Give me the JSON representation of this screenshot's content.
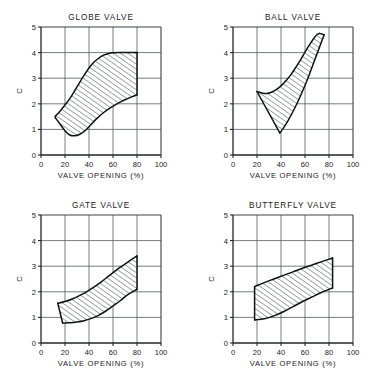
{
  "figure": {
    "background_color": "#ffffff",
    "ink_color": "#1a1a1a",
    "grid_color": "#555a5e",
    "hatch_color": "#2b2f33",
    "panel_count": 4
  },
  "chart_data": [
    {
      "type": "area",
      "title": "GLOBE VALVE",
      "xlabel": "VALVE OPENING (%)",
      "ylabel": "C",
      "xlim": [
        0,
        100
      ],
      "ylim": [
        0,
        5
      ],
      "xticks": [
        0,
        20,
        40,
        60,
        80,
        100
      ],
      "yticks": [
        0,
        1,
        2,
        3,
        4,
        5
      ],
      "xtick_labels": [
        "0",
        "20",
        "40",
        "60",
        "80",
        "100"
      ],
      "ytick_labels": [
        "0",
        "1",
        "2",
        "3",
        "4",
        "5"
      ],
      "grid": true,
      "legend": "none",
      "fill_style": "diagonal-hatch",
      "series": [
        {
          "name": "upper bound",
          "x": [
            12,
            16,
            20,
            24,
            28,
            32,
            36,
            40,
            44,
            48,
            52,
            56,
            60,
            66,
            72,
            80
          ],
          "y": [
            1.52,
            1.72,
            1.95,
            2.2,
            2.5,
            2.82,
            3.12,
            3.4,
            3.62,
            3.78,
            3.9,
            3.96,
            3.99,
            4.0,
            4.0,
            4.0
          ]
        },
        {
          "name": "lower bound",
          "x": [
            12,
            16,
            20,
            24,
            28,
            32,
            36,
            40,
            46,
            52,
            58,
            64,
            70,
            76,
            80
          ],
          "y": [
            1.45,
            1.2,
            0.95,
            0.78,
            0.75,
            0.8,
            0.92,
            1.1,
            1.4,
            1.65,
            1.85,
            2.02,
            2.16,
            2.28,
            2.35
          ]
        }
      ]
    },
    {
      "type": "area",
      "title": "BALL VALVE",
      "xlabel": "VALVE OPENING (%)",
      "ylabel": "C",
      "xlim": [
        0,
        100
      ],
      "ylim": [
        0,
        5
      ],
      "xticks": [
        0,
        20,
        40,
        60,
        80,
        100
      ],
      "yticks": [
        0,
        1,
        2,
        3,
        4,
        5
      ],
      "xtick_labels": [
        "0",
        "20",
        "40",
        "60",
        "80",
        "100"
      ],
      "ytick_labels": [
        "0",
        "1",
        "2",
        "3",
        "4",
        "5"
      ],
      "grid": true,
      "legend": "none",
      "fill_style": "diagonal-hatch",
      "series": [
        {
          "name": "upper bound",
          "x": [
            20,
            24,
            28,
            32,
            36,
            40,
            44,
            48,
            52,
            56,
            60,
            64,
            68,
            70,
            72
          ],
          "y": [
            2.48,
            2.42,
            2.4,
            2.45,
            2.55,
            2.7,
            2.9,
            3.12,
            3.4,
            3.7,
            4.02,
            4.32,
            4.6,
            4.7,
            4.75
          ]
        },
        {
          "name": "lower bound",
          "x": [
            39,
            42,
            46,
            50,
            54,
            58,
            62,
            66,
            70,
            74,
            76
          ],
          "y": [
            0.86,
            1.05,
            1.35,
            1.7,
            2.08,
            2.5,
            2.95,
            3.45,
            3.95,
            4.45,
            4.7
          ]
        }
      ]
    },
    {
      "type": "area",
      "title": "GATE VALVE",
      "xlabel": "VALVE OPENING (%)",
      "ylabel": "C",
      "xlim": [
        0,
        100
      ],
      "ylim": [
        0,
        5
      ],
      "xticks": [
        0,
        20,
        40,
        60,
        80,
        100
      ],
      "yticks": [
        0,
        1,
        2,
        3,
        4,
        5
      ],
      "xtick_labels": [
        "0",
        "20",
        "40",
        "60",
        "80",
        "100"
      ],
      "ytick_labels": [
        "0",
        "1",
        "2",
        "3",
        "4",
        "5"
      ],
      "grid": true,
      "legend": "none",
      "fill_style": "diagonal-hatch",
      "series": [
        {
          "name": "upper bound",
          "x": [
            14,
            20,
            26,
            32,
            38,
            44,
            50,
            56,
            62,
            68,
            74,
            80
          ],
          "y": [
            1.55,
            1.62,
            1.72,
            1.85,
            2.0,
            2.18,
            2.38,
            2.6,
            2.82,
            3.02,
            3.22,
            3.4
          ]
        },
        {
          "name": "lower bound",
          "x": [
            18,
            24,
            30,
            36,
            42,
            48,
            54,
            60,
            66,
            72,
            80
          ],
          "y": [
            0.78,
            0.79,
            0.82,
            0.87,
            0.96,
            1.08,
            1.25,
            1.45,
            1.65,
            1.88,
            2.1
          ]
        }
      ]
    },
    {
      "type": "area",
      "title": "BUTTERFLY VALVE",
      "xlabel": "VALVE OPENING (%)",
      "ylabel": "C",
      "xlim": [
        0,
        100
      ],
      "ylim": [
        0,
        5
      ],
      "xticks": [
        0,
        20,
        40,
        60,
        80,
        100
      ],
      "yticks": [
        0,
        1,
        2,
        3,
        4,
        5
      ],
      "xtick_labels": [
        "0",
        "20",
        "40",
        "60",
        "80",
        "100"
      ],
      "ytick_labels": [
        "0",
        "1",
        "2",
        "3",
        "4",
        "5"
      ],
      "grid": true,
      "legend": "none",
      "fill_style": "diagonal-hatch",
      "series": [
        {
          "name": "upper bound",
          "x": [
            18,
            26,
            34,
            42,
            50,
            58,
            66,
            74,
            83
          ],
          "y": [
            2.2,
            2.36,
            2.5,
            2.64,
            2.78,
            2.92,
            3.05,
            3.18,
            3.32
          ]
        },
        {
          "name": "lower bound",
          "x": [
            18,
            26,
            34,
            42,
            50,
            58,
            66,
            74,
            83
          ],
          "y": [
            0.9,
            0.95,
            1.06,
            1.22,
            1.42,
            1.62,
            1.8,
            1.98,
            2.15
          ]
        }
      ]
    }
  ]
}
